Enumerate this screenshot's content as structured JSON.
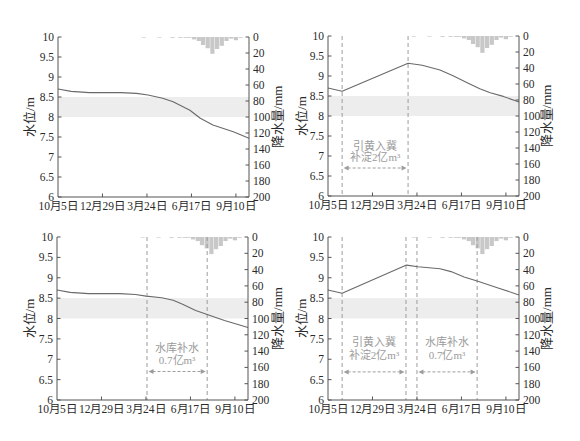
{
  "style": {
    "axis_color": "#555555",
    "curve_color": "#6a6a6a",
    "bar_color": "#c8c8c8",
    "band_color": "#ededed",
    "dash_color": "#9c9c9c",
    "annotation_color": "#9a9a9a"
  },
  "chart_data": [
    {
      "id": "a",
      "type": "line+bar",
      "title": "",
      "x_range": [
        0,
        365
      ],
      "x_ticks": [
        {
          "day": 0,
          "label": "10月5日"
        },
        {
          "day": 85,
          "label": "12月29日"
        },
        {
          "day": 170,
          "label": "3月24日"
        },
        {
          "day": 255,
          "label": "6月17日"
        },
        {
          "day": 340,
          "label": "9月10日"
        }
      ],
      "left_axis": {
        "label": "水位/m",
        "range": [
          6,
          10
        ],
        "ticks": [
          {
            "value": 10,
            "label": "10"
          },
          {
            "value": 9.5,
            "label": "9.5"
          },
          {
            "value": 9,
            "label": "9"
          },
          {
            "value": 8.5,
            "label": "8.5"
          },
          {
            "value": 8,
            "label": "8"
          },
          {
            "value": 7.5,
            "label": "7.5"
          },
          {
            "value": 7,
            "label": "7"
          },
          {
            "value": 6.5,
            "label": "6.5"
          },
          {
            "value": 6,
            "label": "6"
          }
        ]
      },
      "right_axis": {
        "label": "降水量/mm",
        "range": [
          0,
          200
        ],
        "inverted": true,
        "ticks": [
          {
            "value": 0,
            "label": "0"
          },
          {
            "value": 20,
            "label": "20"
          },
          {
            "value": 40,
            "label": "40"
          },
          {
            "value": 60,
            "label": "60"
          },
          {
            "value": 80,
            "label": "80"
          },
          {
            "value": 100,
            "label": "100"
          },
          {
            "value": 120,
            "label": "120"
          },
          {
            "value": 140,
            "label": "140"
          },
          {
            "value": 160,
            "label": "160"
          },
          {
            "value": 180,
            "label": "180"
          },
          {
            "value": 200,
            "label": "200"
          }
        ]
      },
      "band": {
        "from": 8.0,
        "to": 8.5
      },
      "series": [
        {
          "name": "水位",
          "type": "line",
          "points": [
            [
              0,
              8.7
            ],
            [
              25,
              8.64
            ],
            [
              60,
              8.61
            ],
            [
              120,
              8.61
            ],
            [
              150,
              8.59
            ],
            [
              172,
              8.55
            ],
            [
              200,
              8.47
            ],
            [
              220,
              8.38
            ],
            [
              252,
              8.17
            ],
            [
              272,
              7.97
            ],
            [
              296,
              7.8
            ],
            [
              335,
              7.63
            ],
            [
              365,
              7.47
            ]
          ]
        },
        {
          "name": "降水量",
          "type": "bar",
          "bar_width_days": 9,
          "points": [
            [
              160,
              0.5
            ],
            [
              190,
              0.5
            ],
            [
              215,
              1
            ],
            [
              230,
              1
            ],
            [
              240,
              1
            ],
            [
              247,
              1
            ],
            [
              256,
              3
            ],
            [
              265,
              5
            ],
            [
              273,
              10
            ],
            [
              282,
              14
            ],
            [
              291,
              21
            ],
            [
              300,
              15
            ],
            [
              309,
              11
            ],
            [
              318,
              5
            ],
            [
              327,
              2
            ],
            [
              336,
              4
            ],
            [
              345,
              1
            ]
          ]
        }
      ],
      "dashed_lines_days": [],
      "annotations": []
    },
    {
      "id": "b",
      "type": "line+bar",
      "title": "",
      "x_range": [
        0,
        365
      ],
      "x_ticks": [
        {
          "day": 0,
          "label": "10月5日"
        },
        {
          "day": 85,
          "label": "12月29日"
        },
        {
          "day": 170,
          "label": "3月24日"
        },
        {
          "day": 255,
          "label": "6月17日"
        },
        {
          "day": 340,
          "label": "9月10日"
        }
      ],
      "left_axis": {
        "label": "水位/m",
        "range": [
          6,
          10
        ],
        "ticks": [
          {
            "value": 10,
            "label": "10"
          },
          {
            "value": 9.5,
            "label": "9.5"
          },
          {
            "value": 9,
            "label": "9"
          },
          {
            "value": 8.5,
            "label": "8.5"
          },
          {
            "value": 8,
            "label": "8"
          },
          {
            "value": 7.5,
            "label": "7.5"
          },
          {
            "value": 7,
            "label": "7"
          },
          {
            "value": 6.5,
            "label": "6.5"
          },
          {
            "value": 6,
            "label": "6"
          }
        ]
      },
      "right_axis": {
        "label": "降水量/mm",
        "range": [
          0,
          200
        ],
        "inverted": true,
        "ticks": [
          {
            "value": 0,
            "label": "0"
          },
          {
            "value": 20,
            "label": "20"
          },
          {
            "value": 40,
            "label": "40"
          },
          {
            "value": 60,
            "label": "60"
          },
          {
            "value": 80,
            "label": "80"
          },
          {
            "value": 100,
            "label": "100"
          },
          {
            "value": 120,
            "label": "120"
          },
          {
            "value": 140,
            "label": "140"
          },
          {
            "value": 160,
            "label": "160"
          },
          {
            "value": 180,
            "label": "180"
          },
          {
            "value": 200,
            "label": "200"
          }
        ]
      },
      "band": {
        "from": 8.0,
        "to": 8.5
      },
      "series": [
        {
          "name": "水位",
          "type": "line",
          "points": [
            [
              0,
              8.7
            ],
            [
              27,
              8.62
            ],
            [
              153,
              9.32
            ],
            [
              180,
              9.27
            ],
            [
              214,
              9.15
            ],
            [
              240,
              9.0
            ],
            [
              266,
              8.83
            ],
            [
              290,
              8.68
            ],
            [
              310,
              8.58
            ],
            [
              335,
              8.49
            ],
            [
              365,
              8.35
            ]
          ]
        },
        {
          "name": "降水量",
          "type": "bar",
          "bar_width_days": 9,
          "points": [
            [
              160,
              0.5
            ],
            [
              190,
              0.5
            ],
            [
              215,
              1
            ],
            [
              230,
              1
            ],
            [
              240,
              1
            ],
            [
              247,
              1
            ],
            [
              256,
              3
            ],
            [
              265,
              5
            ],
            [
              273,
              10
            ],
            [
              282,
              14
            ],
            [
              291,
              21
            ],
            [
              300,
              15
            ],
            [
              309,
              11
            ],
            [
              318,
              5
            ],
            [
              327,
              2
            ],
            [
              336,
              4
            ],
            [
              345,
              1
            ]
          ]
        }
      ],
      "dashed_lines_days": [
        27,
        153
      ],
      "annotations": [
        {
          "lines": [
            "引黄入冀",
            "补淀2亿m³"
          ],
          "from_day": 27,
          "to_day": 153,
          "text_levels": [
            7.15,
            6.87
          ],
          "arrow_level": 6.7
        }
      ]
    },
    {
      "id": "c",
      "type": "line+bar",
      "title": "",
      "x_range": [
        0,
        365
      ],
      "x_ticks": [
        {
          "day": 0,
          "label": "10月5日"
        },
        {
          "day": 85,
          "label": "12月29日"
        },
        {
          "day": 170,
          "label": "3月24日"
        },
        {
          "day": 255,
          "label": "6月17日"
        },
        {
          "day": 340,
          "label": "9月10日"
        }
      ],
      "left_axis": {
        "label": "水位/m",
        "range": [
          6,
          10
        ],
        "ticks": [
          {
            "value": 10,
            "label": "10"
          },
          {
            "value": 9.5,
            "label": "9.5"
          },
          {
            "value": 9,
            "label": "9"
          },
          {
            "value": 8.5,
            "label": "8.5"
          },
          {
            "value": 8,
            "label": "8"
          },
          {
            "value": 7.5,
            "label": "7.5"
          },
          {
            "value": 7,
            "label": "7"
          },
          {
            "value": 6.5,
            "label": "6.5"
          },
          {
            "value": 6,
            "label": "6"
          }
        ]
      },
      "right_axis": {
        "label": "降水量/mm",
        "range": [
          0,
          200
        ],
        "inverted": true,
        "ticks": [
          {
            "value": 0,
            "label": "0"
          },
          {
            "value": 20,
            "label": "20"
          },
          {
            "value": 40,
            "label": "40"
          },
          {
            "value": 60,
            "label": "60"
          },
          {
            "value": 80,
            "label": "80"
          },
          {
            "value": 100,
            "label": "100"
          },
          {
            "value": 120,
            "label": "120"
          },
          {
            "value": 140,
            "label": "140"
          },
          {
            "value": 160,
            "label": "160"
          },
          {
            "value": 180,
            "label": "180"
          },
          {
            "value": 200,
            "label": "200"
          }
        ]
      },
      "band": {
        "from": 8.0,
        "to": 8.5
      },
      "series": [
        {
          "name": "水位",
          "type": "line",
          "points": [
            [
              0,
              8.7
            ],
            [
              25,
              8.64
            ],
            [
              60,
              8.61
            ],
            [
              120,
              8.61
            ],
            [
              150,
              8.59
            ],
            [
              170,
              8.55
            ],
            [
              200,
              8.51
            ],
            [
              222,
              8.45
            ],
            [
              240,
              8.35
            ],
            [
              265,
              8.2
            ],
            [
              287,
              8.1
            ],
            [
              320,
              7.95
            ],
            [
              365,
              7.78
            ]
          ]
        },
        {
          "name": "降水量",
          "type": "bar",
          "bar_width_days": 9,
          "points": [
            [
              160,
              0.5
            ],
            [
              190,
              0.5
            ],
            [
              215,
              1
            ],
            [
              230,
              1
            ],
            [
              240,
              1
            ],
            [
              247,
              1
            ],
            [
              256,
              3
            ],
            [
              265,
              5
            ],
            [
              273,
              10
            ],
            [
              282,
              14
            ],
            [
              291,
              21
            ],
            [
              300,
              15
            ],
            [
              309,
              11
            ],
            [
              318,
              5
            ],
            [
              327,
              2
            ],
            [
              336,
              4
            ],
            [
              345,
              1
            ]
          ]
        }
      ],
      "dashed_lines_days": [
        172,
        287
      ],
      "annotations": [
        {
          "lines": [
            "水库补水",
            "0.7亿m³"
          ],
          "from_day": 172,
          "to_day": 287,
          "text_levels": [
            7.18,
            6.88
          ],
          "arrow_level": 6.7
        }
      ]
    },
    {
      "id": "d",
      "type": "line+bar",
      "title": "",
      "x_range": [
        0,
        365
      ],
      "x_ticks": [
        {
          "day": 0,
          "label": "10月5日"
        },
        {
          "day": 85,
          "label": "12月29日"
        },
        {
          "day": 170,
          "label": "3月24日"
        },
        {
          "day": 255,
          "label": "6月17日"
        },
        {
          "day": 340,
          "label": "9月10日"
        }
      ],
      "left_axis": {
        "label": "水位/m",
        "range": [
          6,
          10
        ],
        "ticks": [
          {
            "value": 10,
            "label": "10"
          },
          {
            "value": 9.5,
            "label": "9.5"
          },
          {
            "value": 9,
            "label": "9"
          },
          {
            "value": 8.5,
            "label": "8.5"
          },
          {
            "value": 8,
            "label": "8"
          },
          {
            "value": 7.5,
            "label": "7.5"
          },
          {
            "value": 7,
            "label": "7"
          },
          {
            "value": 6.5,
            "label": "6.5"
          },
          {
            "value": 6,
            "label": "6"
          }
        ]
      },
      "right_axis": {
        "label": "降水量/mm",
        "range": [
          0,
          200
        ],
        "inverted": true,
        "ticks": [
          {
            "value": 0,
            "label": "0"
          },
          {
            "value": 20,
            "label": "20"
          },
          {
            "value": 40,
            "label": "40"
          },
          {
            "value": 60,
            "label": "60"
          },
          {
            "value": 80,
            "label": "80"
          },
          {
            "value": 100,
            "label": "100"
          },
          {
            "value": 120,
            "label": "120"
          },
          {
            "value": 140,
            "label": "140"
          },
          {
            "value": 160,
            "label": "160"
          },
          {
            "value": 180,
            "label": "180"
          },
          {
            "value": 200,
            "label": "200"
          }
        ]
      },
      "band": {
        "from": 8.0,
        "to": 8.5
      },
      "series": [
        {
          "name": "水位",
          "type": "line",
          "points": [
            [
              0,
              8.7
            ],
            [
              27,
              8.62
            ],
            [
              150,
              9.31
            ],
            [
              172,
              9.27
            ],
            [
              214,
              9.22
            ],
            [
              235,
              9.15
            ],
            [
              260,
              9.02
            ],
            [
              285,
              8.92
            ],
            [
              325,
              8.75
            ],
            [
              365,
              8.58
            ]
          ]
        },
        {
          "name": "降水量",
          "type": "bar",
          "bar_width_days": 9,
          "points": [
            [
              160,
              0.5
            ],
            [
              190,
              0.5
            ],
            [
              215,
              1
            ],
            [
              230,
              1
            ],
            [
              240,
              1
            ],
            [
              247,
              1
            ],
            [
              256,
              3
            ],
            [
              265,
              5
            ],
            [
              273,
              10
            ],
            [
              282,
              14
            ],
            [
              291,
              21
            ],
            [
              300,
              15
            ],
            [
              309,
              11
            ],
            [
              318,
              5
            ],
            [
              327,
              2
            ],
            [
              336,
              4
            ],
            [
              345,
              1
            ]
          ]
        }
      ],
      "dashed_lines_days": [
        27,
        149,
        170,
        285
      ],
      "annotations": [
        {
          "lines": [
            "引黄入冀",
            "补淀2亿m³"
          ],
          "from_day": 27,
          "to_day": 149,
          "text_levels": [
            7.33,
            7.0
          ],
          "arrow_level": 6.69
        },
        {
          "lines": [
            "水库补水",
            "0.7亿m³"
          ],
          "from_day": 170,
          "to_day": 285,
          "text_levels": [
            7.33,
            7.0
          ],
          "arrow_level": 6.69
        }
      ]
    }
  ]
}
